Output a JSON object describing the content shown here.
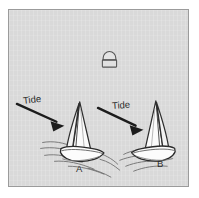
{
  "figure": {
    "kind": "nautical-diagram",
    "caption_absent": true,
    "background_color": "#d9d9d9",
    "border_color": "#9b9b9b",
    "ink_color": "#2a2a2a"
  },
  "annotations": {
    "tide_label_a": "Tide",
    "tide_label_b": "Tide",
    "boat_label_a": "A",
    "boat_label_b": "B"
  },
  "objects": {
    "buoy": {
      "name": "mooring-buoy",
      "position": {
        "x": 108,
        "y": 61
      }
    },
    "boat_a": {
      "name": "sailboat-a",
      "label": "A",
      "heading": "bow-right",
      "sails": 2
    },
    "boat_b": {
      "name": "sailboat-b",
      "label": "B",
      "heading": "bow-left",
      "sails": 2
    },
    "arrow_a": {
      "name": "tide-arrow-a",
      "direction": "down-right",
      "from": {
        "x": 16,
        "y": 104
      },
      "to": {
        "x": 62,
        "y": 124
      }
    },
    "arrow_b": {
      "name": "tide-arrow-b",
      "direction": "down-right",
      "from": {
        "x": 98,
        "y": 108
      },
      "to": {
        "x": 142,
        "y": 128
      }
    }
  }
}
